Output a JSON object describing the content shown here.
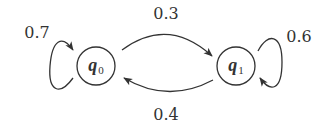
{
  "diagram": {
    "type": "markov-chain",
    "states": [
      {
        "id": "q0",
        "symbol": "q",
        "subscript": "0"
      },
      {
        "id": "q1",
        "symbol": "q",
        "subscript": "1"
      }
    ],
    "transitions": [
      {
        "from": "q0",
        "to": "q0",
        "label": "0.7"
      },
      {
        "from": "q0",
        "to": "q1",
        "label": "0.3"
      },
      {
        "from": "q1",
        "to": "q0",
        "label": "0.4"
      },
      {
        "from": "q1",
        "to": "q1",
        "label": "0.6"
      }
    ],
    "colors": {
      "stroke": "#333333",
      "background": "#ffffff"
    }
  }
}
